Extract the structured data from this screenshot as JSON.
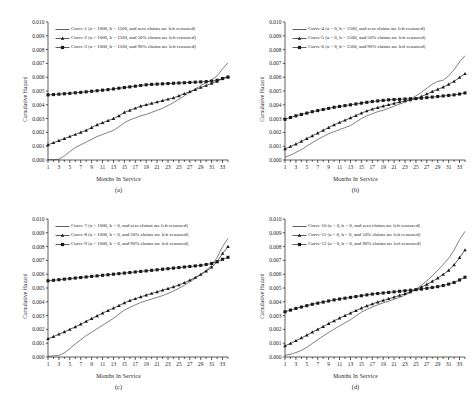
{
  "figure": {
    "background": "#ffffff",
    "ink": "#1a1a1a",
    "axis_title_y": "Cumulative Hazard",
    "axis_title_x": "Months In Service"
  },
  "panels": [
    {
      "id": "a",
      "label": "(a)",
      "legend": [
        {
          "marker": "line",
          "text": "Curve-1 (a = 1000, b = 1500, and zero claims are left censored)"
        },
        {
          "marker": "triangle",
          "text": "Curve-2 (a = 1000, b = 1500, and 50% claims are left censored)"
        },
        {
          "marker": "square",
          "text": "Curve-3 (a = 1000, b = 1500, and 90% claims are left censored)"
        }
      ],
      "chart_data": {
        "type": "line",
        "title": "",
        "xlabel": "Months In Service",
        "ylabel": "Cumulative Hazard",
        "xlim": [
          1,
          34
        ],
        "ylim": [
          0.0,
          0.01
        ],
        "yticks": [
          "0.000",
          "0.001",
          "0.002",
          "0.003",
          "0.004",
          "0.005",
          "0.006",
          "0.007",
          "0.008",
          "0.009",
          "0.010"
        ],
        "xticks": [
          1,
          3,
          5,
          7,
          9,
          11,
          13,
          15,
          17,
          19,
          21,
          23,
          25,
          27,
          29,
          31,
          33
        ],
        "grid": false,
        "legend_position": "top-left",
        "x": [
          1,
          2,
          3,
          4,
          5,
          6,
          7,
          8,
          9,
          10,
          11,
          12,
          13,
          14,
          15,
          16,
          17,
          18,
          19,
          20,
          21,
          22,
          23,
          24,
          25,
          26,
          27,
          28,
          29,
          30,
          31,
          32,
          33,
          34
        ],
        "series": [
          {
            "name": "Curve-1",
            "marker": "none",
            "values": [
              2e-05,
              3e-05,
              5e-05,
              0.0003,
              0.0006,
              0.0009,
              0.0011,
              0.0013,
              0.0015,
              0.0017,
              0.00185,
              0.002,
              0.00215,
              0.0024,
              0.0027,
              0.0029,
              0.00305,
              0.0032,
              0.0033,
              0.00345,
              0.0036,
              0.00375,
              0.00395,
              0.00415,
              0.0044,
              0.00465,
              0.0049,
              0.00515,
              0.0054,
              0.0056,
              0.0058,
              0.0061,
              0.0066,
              0.00705
            ]
          },
          {
            "name": "Curve-2",
            "marker": "triangle",
            "values": [
              0.0011,
              0.00125,
              0.0014,
              0.00155,
              0.0017,
              0.00185,
              0.002,
              0.00215,
              0.00235,
              0.00255,
              0.0027,
              0.00285,
              0.003,
              0.0032,
              0.00345,
              0.0036,
              0.00375,
              0.0039,
              0.004,
              0.0041,
              0.0042,
              0.0043,
              0.0044,
              0.0045,
              0.00465,
              0.0048,
              0.00495,
              0.0051,
              0.00525,
              0.0054,
              0.00555,
              0.0057,
              0.0059,
              0.00605
            ]
          },
          {
            "name": "Curve-3",
            "marker": "square",
            "values": [
              0.00472,
              0.00474,
              0.00477,
              0.0048,
              0.00483,
              0.00487,
              0.0049,
              0.00494,
              0.00498,
              0.00502,
              0.00506,
              0.0051,
              0.00515,
              0.0052,
              0.00525,
              0.0053,
              0.00535,
              0.0054,
              0.00545,
              0.00548,
              0.0055,
              0.00552,
              0.00554,
              0.00556,
              0.00558,
              0.0056,
              0.00562,
              0.00564,
              0.00566,
              0.00568,
              0.00572,
              0.00578,
              0.0059,
              0.006
            ]
          }
        ]
      }
    },
    {
      "id": "b",
      "label": "(b)",
      "legend": [
        {
          "marker": "line",
          "text": "Curve-4 (a = 0, b = 1500, and zero claims are left censored)"
        },
        {
          "marker": "triangle",
          "text": "Curve-5 (a = 0, b = 1500, and 50% claims are left censored)"
        },
        {
          "marker": "square",
          "text": "Curve-6 (a = 0, b = 1500, and 90% claims are left censored)"
        }
      ],
      "chart_data": {
        "type": "line",
        "title": "",
        "xlabel": "Months In Service",
        "ylabel": "Cumulative Hazard",
        "xlim": [
          1,
          34
        ],
        "ylim": [
          0.0,
          0.01
        ],
        "yticks": [
          "0.000",
          "0.001",
          "0.002",
          "0.003",
          "0.004",
          "0.005",
          "0.006",
          "0.007",
          "0.008",
          "0.009",
          "0.010"
        ],
        "xticks": [
          1,
          3,
          5,
          7,
          9,
          11,
          13,
          15,
          17,
          19,
          21,
          23,
          25,
          27,
          29,
          31,
          33
        ],
        "grid": false,
        "legend_position": "top-left",
        "x": [
          1,
          2,
          3,
          4,
          5,
          6,
          7,
          8,
          9,
          10,
          11,
          12,
          13,
          14,
          15,
          16,
          17,
          18,
          19,
          20,
          21,
          22,
          23,
          24,
          25,
          26,
          27,
          28,
          29,
          30,
          31,
          32,
          33,
          34
        ],
        "series": [
          {
            "name": "Curve-4",
            "marker": "none",
            "values": [
              0.0002,
              0.00035,
              0.00055,
              0.00075,
              0.001,
              0.00125,
              0.0015,
              0.0017,
              0.0019,
              0.00205,
              0.0022,
              0.00235,
              0.0025,
              0.00275,
              0.003,
              0.0032,
              0.00335,
              0.0035,
              0.0036,
              0.00375,
              0.0039,
              0.00405,
              0.0042,
              0.0044,
              0.00465,
              0.0049,
              0.0052,
              0.0055,
              0.0057,
              0.00578,
              0.0061,
              0.00655,
              0.0071,
              0.00755
            ]
          },
          {
            "name": "Curve-5",
            "marker": "triangle",
            "values": [
              0.0008,
              0.00098,
              0.00115,
              0.00135,
              0.00155,
              0.00175,
              0.00195,
              0.00215,
              0.00235,
              0.00255,
              0.00272,
              0.00288,
              0.00305,
              0.00322,
              0.0034,
              0.00355,
              0.00368,
              0.0038,
              0.0039,
              0.004,
              0.0041,
              0.0042,
              0.00428,
              0.00436,
              0.00444,
              0.0046,
              0.00478,
              0.00496,
              0.00512,
              0.00528,
              0.00548,
              0.0057,
              0.00598,
              0.00625
            ]
          },
          {
            "name": "Curve-6",
            "marker": "square",
            "values": [
              0.00295,
              0.00308,
              0.0032,
              0.0033,
              0.0034,
              0.0035,
              0.00358,
              0.00366,
              0.00374,
              0.00382,
              0.00388,
              0.00394,
              0.004,
              0.00406,
              0.00412,
              0.00418,
              0.00424,
              0.00428,
              0.00432,
              0.00436,
              0.00438,
              0.0044,
              0.00442,
              0.00444,
              0.00445,
              0.00448,
              0.00452,
              0.00456,
              0.0046,
              0.00464,
              0.00468,
              0.00472,
              0.00478,
              0.00486
            ]
          }
        ]
      }
    },
    {
      "id": "c",
      "label": "(c)",
      "legend": [
        {
          "marker": "line",
          "text": "Curve-7 (a = 1000, b = 0, and zero claims are left censored)"
        },
        {
          "marker": "triangle",
          "text": "Curve-8 (a = 1000, b = 0, and 50% claims are left censored)"
        },
        {
          "marker": "square",
          "text": "Curve-9 (a = 1000, b = 0, and 90% claims are left censored)"
        }
      ],
      "chart_data": {
        "type": "line",
        "title": "",
        "xlabel": "Months In Service",
        "ylabel": "Cumulative Hazard",
        "xlim": [
          1,
          34
        ],
        "ylim": [
          0.0,
          0.01
        ],
        "yticks": [
          "0.000",
          "0.001",
          "0.002",
          "0.003",
          "0.004",
          "0.005",
          "0.006",
          "0.007",
          "0.008",
          "0.009",
          "0.010"
        ],
        "xticks": [
          1,
          3,
          5,
          7,
          9,
          11,
          13,
          15,
          17,
          19,
          21,
          23,
          25,
          27,
          29,
          31,
          33
        ],
        "grid": false,
        "legend_position": "top-left",
        "x": [
          1,
          2,
          3,
          4,
          5,
          6,
          7,
          8,
          9,
          10,
          11,
          12,
          13,
          14,
          15,
          16,
          17,
          18,
          19,
          20,
          21,
          22,
          23,
          24,
          25,
          26,
          27,
          28,
          29,
          30,
          31,
          32,
          33,
          34
        ],
        "series": [
          {
            "name": "Curve-7",
            "marker": "none",
            "values": [
              5e-05,
              8e-05,
              0.00012,
              0.0003,
              0.0006,
              0.00095,
              0.00125,
              0.00155,
              0.0018,
              0.00205,
              0.0023,
              0.00255,
              0.0028,
              0.0031,
              0.0034,
              0.0036,
              0.00378,
              0.00395,
              0.00408,
              0.0042,
              0.00432,
              0.00445,
              0.0046,
              0.00478,
              0.00498,
              0.0052,
              0.00545,
              0.0057,
              0.00598,
              0.00628,
              0.00665,
              0.0072,
              0.008,
              0.0086
            ]
          },
          {
            "name": "Curve-8",
            "marker": "triangle",
            "values": [
              0.00132,
              0.00148,
              0.00165,
              0.00182,
              0.002,
              0.00218,
              0.00238,
              0.00258,
              0.00278,
              0.00298,
              0.00318,
              0.00336,
              0.00354,
              0.00372,
              0.00392,
              0.00408,
              0.00422,
              0.00436,
              0.00448,
              0.0046,
              0.00472,
              0.00484,
              0.00496,
              0.00508,
              0.00522,
              0.00538,
              0.00556,
              0.00576,
              0.00598,
              0.00622,
              0.0065,
              0.0069,
              0.0075,
              0.008
            ]
          },
          {
            "name": "Curve-9",
            "marker": "square",
            "values": [
              0.00552,
              0.00556,
              0.0056,
              0.00564,
              0.00568,
              0.00572,
              0.00576,
              0.0058,
              0.00584,
              0.00588,
              0.00592,
              0.00596,
              0.006,
              0.00604,
              0.00608,
              0.00612,
              0.00616,
              0.0062,
              0.00624,
              0.00628,
              0.00632,
              0.00636,
              0.0064,
              0.00644,
              0.00648,
              0.00652,
              0.00656,
              0.0066,
              0.00664,
              0.0067,
              0.00678,
              0.0069,
              0.00708,
              0.00722
            ]
          }
        ]
      }
    },
    {
      "id": "d",
      "label": "(d)",
      "legend": [
        {
          "marker": "line",
          "text": "Curve-10 (a = 0, b = 0, and zero claims are left censored)"
        },
        {
          "marker": "triangle",
          "text": "Curve-11 (a = 0, b = 0, and 50% claims are left censored)"
        },
        {
          "marker": "square",
          "text": "Curve-12 (a = 0, b = 0, and 90% claims are left censored)"
        }
      ],
      "chart_data": {
        "type": "line",
        "title": "",
        "xlabel": "Months In Service",
        "ylabel": "Cumulative Hazard",
        "xlim": [
          1,
          34
        ],
        "ylim": [
          0.0,
          0.01
        ],
        "yticks": [
          "0.000",
          "0.001",
          "0.002",
          "0.003",
          "0.004",
          "0.005",
          "0.006",
          "0.007",
          "0.008",
          "0.009",
          "0.010"
        ],
        "xticks": [
          1,
          3,
          5,
          7,
          9,
          11,
          13,
          15,
          17,
          19,
          21,
          23,
          25,
          27,
          29,
          31,
          33
        ],
        "grid": false,
        "legend_position": "top-left",
        "x": [
          1,
          2,
          3,
          4,
          5,
          6,
          7,
          8,
          9,
          10,
          11,
          12,
          13,
          14,
          15,
          16,
          17,
          18,
          19,
          20,
          21,
          22,
          23,
          24,
          25,
          26,
          27,
          28,
          29,
          30,
          31,
          32,
          33,
          34
        ],
        "series": [
          {
            "name": "Curve-10",
            "marker": "none",
            "values": [
              0.00012,
              0.0002,
              0.00032,
              0.00048,
              0.0007,
              0.00098,
              0.00125,
              0.00152,
              0.00178,
              0.00202,
              0.00225,
              0.00248,
              0.0027,
              0.00298,
              0.00325,
              0.00345,
              0.00362,
              0.00378,
              0.00392,
              0.00405,
              0.00418,
              0.00432,
              0.00448,
              0.00468,
              0.00492,
              0.0052,
              0.00552,
              0.00588,
              0.00628,
              0.0067,
              0.00715,
              0.00775,
              0.0085,
              0.0091
            ]
          },
          {
            "name": "Curve-11",
            "marker": "triangle",
            "values": [
              0.0008,
              0.00098,
              0.00118,
              0.00138,
              0.00158,
              0.0018,
              0.002,
              0.0022,
              0.00242,
              0.00262,
              0.00282,
              0.003,
              0.00318,
              0.00336,
              0.00354,
              0.0037,
              0.00384,
              0.00398,
              0.0041,
              0.00422,
              0.00434,
              0.00446,
              0.00458,
              0.00472,
              0.00488,
              0.00506,
              0.00526,
              0.00548,
              0.00572,
              0.00598,
              0.00628,
              0.00668,
              0.0072,
              0.00775
            ]
          },
          {
            "name": "Curve-12",
            "marker": "square",
            "values": [
              0.00328,
              0.0034,
              0.00352,
              0.00362,
              0.00372,
              0.00382,
              0.0039,
              0.00398,
              0.00406,
              0.00414,
              0.0042,
              0.00426,
              0.00432,
              0.00438,
              0.00444,
              0.0045,
              0.00456,
              0.0046,
              0.00464,
              0.00468,
              0.00472,
              0.00476,
              0.0048,
              0.00484,
              0.00488,
              0.00492,
              0.00498,
              0.00504,
              0.0051,
              0.00518,
              0.00528,
              0.0054,
              0.00558,
              0.00578
            ]
          }
        ]
      }
    }
  ]
}
